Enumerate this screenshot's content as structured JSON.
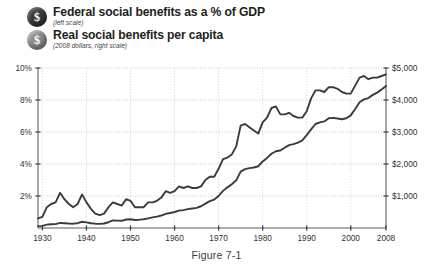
{
  "figure": {
    "caption": "Figure 7-1"
  },
  "legend": {
    "items": [
      {
        "badge_glyph": "$",
        "badge_name": "dollar-badge-dark",
        "title": "Federal social benefits as a % of GDP",
        "subtitle": "(left scale)"
      },
      {
        "badge_glyph": "$",
        "badge_name": "dollar-badge-gray",
        "title": "Real social benefits per capita",
        "subtitle": "(2008 dollars, right scale)"
      }
    ]
  },
  "axes": {
    "left": {
      "labels": [
        "10%",
        "8%",
        "6%",
        "4%",
        "2%"
      ],
      "values": [
        10,
        8,
        6,
        4,
        2
      ]
    },
    "right": {
      "labels": [
        "$5,000",
        "$4,000",
        "$3,000",
        "$2,000",
        "$1,000"
      ],
      "values": [
        5000,
        4000,
        3000,
        2000,
        1000
      ]
    },
    "bottom": {
      "labels": [
        "1930",
        "1940",
        "1950",
        "1960",
        "1970",
        "1980",
        "1990",
        "2000",
        "2008"
      ],
      "values": [
        1930,
        1940,
        1950,
        1960,
        1970,
        1980,
        1990,
        2000,
        2008
      ]
    }
  },
  "chart_data": {
    "type": "line",
    "title": "",
    "xlabel": "",
    "ylabel": "Federal social benefits as a % of GDP",
    "y2label": "Real social benefits per capita (2008 dollars)",
    "xlim": [
      1929,
      2008
    ],
    "ylim": [
      0,
      10
    ],
    "y2lim": [
      0,
      5000
    ],
    "grid": true,
    "legend_position": "top-left",
    "x": [
      1929,
      1930,
      1931,
      1932,
      1933,
      1934,
      1935,
      1936,
      1937,
      1938,
      1939,
      1940,
      1941,
      1942,
      1943,
      1944,
      1945,
      1946,
      1947,
      1948,
      1949,
      1950,
      1951,
      1952,
      1953,
      1954,
      1955,
      1956,
      1957,
      1958,
      1959,
      1960,
      1961,
      1962,
      1963,
      1964,
      1965,
      1966,
      1967,
      1968,
      1969,
      1970,
      1971,
      1972,
      1973,
      1974,
      1975,
      1976,
      1977,
      1978,
      1979,
      1980,
      1981,
      1982,
      1983,
      1984,
      1985,
      1986,
      1987,
      1988,
      1989,
      1990,
      1991,
      1992,
      1993,
      1994,
      1995,
      1996,
      1997,
      1998,
      1999,
      2000,
      2001,
      2002,
      2003,
      2004,
      2005,
      2006,
      2007,
      2008
    ],
    "series": [
      {
        "name": "Federal social benefits as a % of GDP",
        "axis": "left",
        "units": "percent of GDP",
        "values": [
          0.6,
          0.7,
          1.3,
          1.5,
          1.6,
          2.2,
          1.8,
          1.5,
          1.3,
          1.5,
          2.1,
          1.6,
          1.2,
          0.9,
          0.8,
          0.9,
          1.3,
          1.6,
          1.5,
          1.4,
          1.8,
          1.7,
          1.3,
          1.3,
          1.3,
          1.6,
          1.6,
          1.7,
          1.9,
          2.3,
          2.2,
          2.3,
          2.6,
          2.5,
          2.6,
          2.5,
          2.5,
          2.6,
          3.0,
          3.2,
          3.2,
          3.7,
          4.3,
          4.4,
          4.6,
          5.1,
          6.4,
          6.5,
          6.3,
          6.1,
          5.9,
          6.6,
          6.9,
          7.5,
          7.6,
          7.1,
          7.1,
          7.2,
          7.0,
          6.9,
          6.9,
          7.3,
          8.1,
          8.6,
          8.6,
          8.5,
          8.8,
          8.8,
          8.7,
          8.5,
          8.4,
          8.4,
          8.9,
          9.4,
          9.5,
          9.3,
          9.4,
          9.4,
          9.5,
          9.6
        ]
      },
      {
        "name": "Real social benefits per capita",
        "axis": "right",
        "units": "2008 dollars",
        "values": [
          60,
          65,
          105,
          115,
          120,
          160,
          150,
          140,
          135,
          150,
          195,
          175,
          150,
          135,
          130,
          140,
          180,
          235,
          230,
          225,
          265,
          275,
          250,
          260,
          275,
          300,
          330,
          355,
          390,
          440,
          470,
          500,
          545,
          560,
          590,
          610,
          630,
          680,
          760,
          840,
          890,
          1000,
          1160,
          1270,
          1370,
          1490,
          1760,
          1840,
          1870,
          1890,
          1930,
          2080,
          2190,
          2320,
          2400,
          2420,
          2510,
          2590,
          2620,
          2670,
          2740,
          2900,
          3080,
          3250,
          3300,
          3330,
          3430,
          3440,
          3420,
          3400,
          3430,
          3520,
          3720,
          3930,
          4020,
          4060,
          4160,
          4230,
          4330,
          4440
        ]
      }
    ]
  }
}
